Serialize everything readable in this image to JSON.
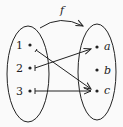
{
  "function_label": "f",
  "domain_set": {
    "elements": [
      "1",
      "2",
      "3"
    ]
  },
  "codomain_set": {
    "elements": [
      "a",
      "b",
      "c"
    ]
  },
  "mappings": [
    {
      "from": "1",
      "to": "c"
    },
    {
      "from": "2",
      "to": "a"
    },
    {
      "from": "3",
      "to": "c"
    }
  ],
  "colors": {
    "stroke": "#222222",
    "background": "#fafafa"
  }
}
